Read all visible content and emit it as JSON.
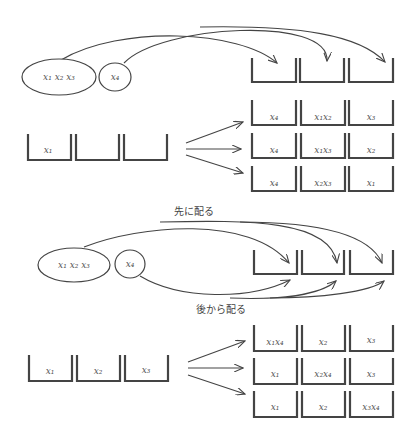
{
  "figure": {
    "top": {
      "groups": [
        {
          "label": "x₁ x₂ x₃"
        },
        {
          "label": "x₄"
        }
      ],
      "source_boxes": [
        "x₁",
        "",
        ""
      ],
      "target_rows": [
        [
          "x₄",
          "x₁x₂",
          "x₃"
        ],
        [
          "x₄",
          "x₁x₃",
          "x₂"
        ],
        [
          "x₄",
          "x₂x₃",
          "x₁"
        ]
      ]
    },
    "bottom": {
      "label_first": "先に配る",
      "label_later": "後から配る",
      "groups": [
        {
          "label": "x₁ x₂ x₃"
        },
        {
          "label": "x₄"
        }
      ],
      "source_boxes": [
        "x₁",
        "x₂",
        "x₃"
      ],
      "target_rows": [
        [
          "x₁x₄",
          "x₂",
          "x₃"
        ],
        [
          "x₁",
          "x₂x₄",
          "x₃"
        ],
        [
          "x₁",
          "x₂",
          "x₃x₄"
        ]
      ]
    }
  }
}
